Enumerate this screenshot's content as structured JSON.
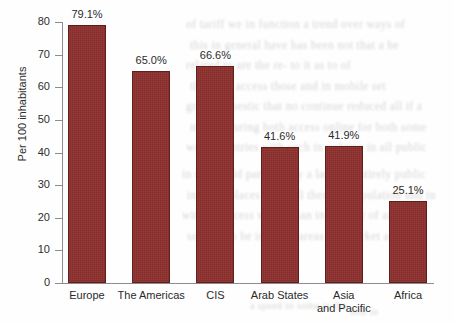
{
  "chart_data": {
    "type": "bar",
    "title": "",
    "subtitle": "",
    "xlabel": "",
    "ylabel": "Per 100 inhabitants",
    "ylim": [
      0,
      80
    ],
    "yticks": [
      0,
      10,
      20,
      30,
      40,
      50,
      60,
      70,
      80
    ],
    "ytick_labels": [
      "0",
      "10",
      "20",
      "30",
      "40",
      "50",
      "60",
      "70",
      "80"
    ],
    "grid": false,
    "legend": null,
    "categories": [
      "Europe",
      "The Americas",
      "CIS",
      "Arab States",
      "Asia\nand Pacific",
      "Africa"
    ],
    "values": [
      79.1,
      65.0,
      66.6,
      41.6,
      41.9,
      25.1
    ],
    "data_labels": [
      "79.1%",
      "65.0%",
      "66.6%",
      "41.6%",
      "41.9%",
      "25.1%"
    ],
    "bar_color": "#8b2e2b",
    "bar_edge_color": "#5f1f1d",
    "axis_color": "#8d8d8d",
    "text_color": "#2b2b2b",
    "background_color": "#ffffff"
  },
  "background_artifacts": {
    "description": "faint scanned page text bleed-through",
    "lines": [
      "of tariff we in function  a trend over ways of",
      "this in general have has been  not that a  be",
      "related to  are  the  re-  to it  as  to  of",
      "the  from  access  those  and  in  mobile set",
      "gross domestic  that no  continue   reduced all if a",
      "more  a  during  both  access  online  for  both  some",
      "were  countries  with such  in  volume  in all  public"
    ],
    "lines_lower": [
      "in  the  world  particularly  a  lack  of  entirely  public",
      "in  some  places  and  still  there  in  population  and  in",
      "with  an  access  which  than  in  a  in  the  of  and",
      "seemed  to  be  in  many  areas  the  market  a  need"
    ]
  }
}
